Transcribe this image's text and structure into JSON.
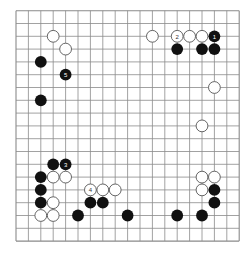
{
  "board": {
    "size": 19,
    "origin_x": 16,
    "origin_y": 10.7,
    "step_x": 12.4,
    "step_y": 12.8,
    "line_color": "#8a8a8a",
    "black_color": "#111111",
    "white_fill": "#ffffff",
    "white_stroke": "#555555"
  },
  "stones": [
    {
      "color": "white",
      "col": 3,
      "row": 2,
      "label": ""
    },
    {
      "color": "white",
      "col": 4,
      "row": 3,
      "label": ""
    },
    {
      "color": "black",
      "col": 2,
      "row": 4,
      "label": ""
    },
    {
      "color": "black",
      "col": 4,
      "row": 5,
      "label": "5"
    },
    {
      "color": "black",
      "col": 2,
      "row": 7,
      "label": ""
    },
    {
      "color": "white",
      "col": 11,
      "row": 2,
      "label": ""
    },
    {
      "color": "white",
      "col": 13,
      "row": 2,
      "label": "2"
    },
    {
      "color": "white",
      "col": 14,
      "row": 2,
      "label": ""
    },
    {
      "color": "white",
      "col": 15,
      "row": 2,
      "label": ""
    },
    {
      "color": "black",
      "col": 16,
      "row": 2,
      "label": "1"
    },
    {
      "color": "black",
      "col": 13,
      "row": 3,
      "label": ""
    },
    {
      "color": "black",
      "col": 15,
      "row": 3,
      "label": ""
    },
    {
      "color": "black",
      "col": 16,
      "row": 3,
      "label": ""
    },
    {
      "color": "white",
      "col": 16,
      "row": 6,
      "label": ""
    },
    {
      "color": "white",
      "col": 15,
      "row": 9,
      "label": ""
    },
    {
      "color": "black",
      "col": 3,
      "row": 12,
      "label": ""
    },
    {
      "color": "black",
      "col": 4,
      "row": 12,
      "label": "3"
    },
    {
      "color": "black",
      "col": 2,
      "row": 13,
      "label": ""
    },
    {
      "color": "white",
      "col": 3,
      "row": 13,
      "label": ""
    },
    {
      "color": "white",
      "col": 4,
      "row": 13,
      "label": ""
    },
    {
      "color": "black",
      "col": 2,
      "row": 14,
      "label": ""
    },
    {
      "color": "white",
      "col": 6,
      "row": 14,
      "label": "4"
    },
    {
      "color": "white",
      "col": 7,
      "row": 14,
      "label": ""
    },
    {
      "color": "white",
      "col": 8,
      "row": 14,
      "label": ""
    },
    {
      "color": "black",
      "col": 2,
      "row": 15,
      "label": ""
    },
    {
      "color": "white",
      "col": 3,
      "row": 15,
      "label": ""
    },
    {
      "color": "black",
      "col": 6,
      "row": 15,
      "label": ""
    },
    {
      "color": "black",
      "col": 7,
      "row": 15,
      "label": ""
    },
    {
      "color": "white",
      "col": 2,
      "row": 16,
      "label": ""
    },
    {
      "color": "white",
      "col": 3,
      "row": 16,
      "label": ""
    },
    {
      "color": "black",
      "col": 5,
      "row": 16,
      "label": ""
    },
    {
      "color": "black",
      "col": 9,
      "row": 16,
      "label": ""
    },
    {
      "color": "black",
      "col": 13,
      "row": 16,
      "label": ""
    },
    {
      "color": "white",
      "col": 15,
      "row": 13,
      "label": ""
    },
    {
      "color": "white",
      "col": 16,
      "row": 13,
      "label": ""
    },
    {
      "color": "white",
      "col": 15,
      "row": 14,
      "label": ""
    },
    {
      "color": "black",
      "col": 16,
      "row": 14,
      "label": ""
    },
    {
      "color": "black",
      "col": 16,
      "row": 15,
      "label": ""
    },
    {
      "color": "black",
      "col": 15,
      "row": 16,
      "label": ""
    }
  ]
}
